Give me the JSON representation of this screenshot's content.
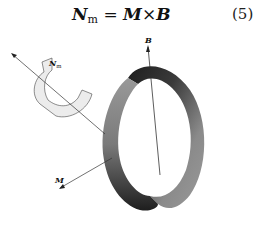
{
  "equation": {
    "lhs": "N",
    "lhs_subscript": "m",
    "equals": "=",
    "term1": "M",
    "operator": "×",
    "term2": "B",
    "number": "(5)"
  },
  "figure": {
    "labels": {
      "torque": "N",
      "torque_subscript": "m",
      "field": "B",
      "moment": "M"
    },
    "colors": {
      "ring_dark": "#1e1e1e",
      "ring_mid": "#6a6a6a",
      "ring_light": "#b8b8b8",
      "arrow_fill": "#e6e6e6",
      "line": "#333333"
    }
  }
}
